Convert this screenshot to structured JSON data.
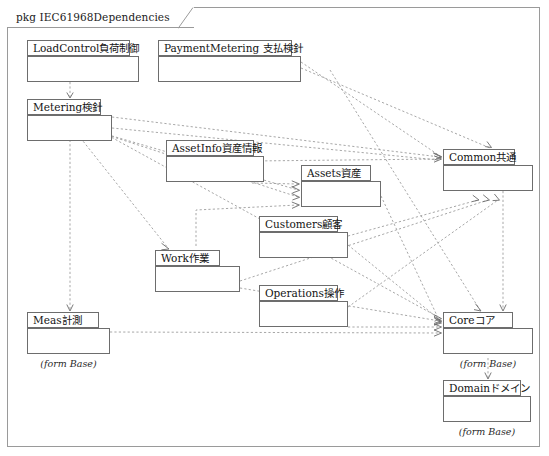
{
  "frame": {
    "keyword": "pkg",
    "name": "IEC61968Dependencies",
    "title": "pkg IEC61968Dependencies"
  },
  "packages": [
    {
      "id": "loadcontrol",
      "label": "LoadControl負荷制御",
      "name_en": "LoadControl",
      "name_ja": "負荷制御",
      "note": "",
      "x": 27,
      "y": 40,
      "tab_w": 103,
      "tab_h": 16,
      "body_w": 112,
      "body_h": 26
    },
    {
      "id": "paymentmetering",
      "label": "PaymentMetering 支払検針",
      "name_en": "PaymentMetering",
      "name_ja": "支払検針",
      "note": "",
      "x": 158,
      "y": 40,
      "tab_w": 134,
      "tab_h": 16,
      "body_w": 143,
      "body_h": 26
    },
    {
      "id": "metering",
      "label": "Metering検針",
      "name_en": "Metering",
      "name_ja": "検針",
      "note": "",
      "x": 27,
      "y": 99,
      "tab_w": 74,
      "tab_h": 16,
      "body_w": 85,
      "body_h": 26
    },
    {
      "id": "assetinfo",
      "label": "AssetInfo資産情報",
      "name_en": "AssetInfo",
      "name_ja": "資産情報",
      "note": "",
      "x": 166,
      "y": 140,
      "tab_w": 88,
      "tab_h": 16,
      "body_w": 98,
      "body_h": 26
    },
    {
      "id": "assets",
      "label": "Assets資産",
      "name_en": "Assets",
      "name_ja": "資産",
      "note": "",
      "x": 301,
      "y": 165,
      "tab_w": 70,
      "tab_h": 16,
      "body_w": 80,
      "body_h": 26
    },
    {
      "id": "customers",
      "label": "Customers顧客",
      "name_en": "Customers",
      "name_ja": "顧客",
      "note": "",
      "x": 259,
      "y": 216,
      "tab_w": 79,
      "tab_h": 16,
      "body_w": 89,
      "body_h": 26
    },
    {
      "id": "work",
      "label": "Work作業",
      "name_en": "Work",
      "name_ja": "作業",
      "note": "",
      "x": 155,
      "y": 250,
      "tab_w": 65,
      "tab_h": 16,
      "body_w": 85,
      "body_h": 26
    },
    {
      "id": "operations",
      "label": "Operations操作",
      "name_en": "Operations",
      "name_ja": "操作",
      "note": "",
      "x": 259,
      "y": 285,
      "tab_w": 79,
      "tab_h": 16,
      "body_w": 89,
      "body_h": 26
    },
    {
      "id": "meas",
      "label": "Meas計測",
      "name_en": "Meas",
      "name_ja": "計測",
      "note": "(form Base)",
      "x": 27,
      "y": 312,
      "tab_w": 72,
      "tab_h": 16,
      "body_w": 83,
      "body_h": 26
    },
    {
      "id": "common",
      "label": "Common共通",
      "name_en": "Common",
      "name_ja": "共通",
      "note": "",
      "x": 443,
      "y": 149,
      "tab_w": 72,
      "tab_h": 16,
      "body_w": 90,
      "body_h": 26
    },
    {
      "id": "core",
      "label": "Coreコア",
      "name_en": "Core",
      "name_ja": "コア",
      "note": "(form Base)",
      "x": 443,
      "y": 312,
      "tab_w": 70,
      "tab_h": 16,
      "body_w": 90,
      "body_h": 26
    },
    {
      "id": "domain",
      "label": "Domainドメイン",
      "name_en": "Domain",
      "name_ja": "ドメイン",
      "note": "(form Base)",
      "x": 443,
      "y": 380,
      "tab_w": 78,
      "tab_h": 16,
      "body_w": 88,
      "body_h": 26
    }
  ],
  "dependencies": [
    {
      "from": "loadcontrol",
      "to": "metering"
    },
    {
      "from": "paymentmetering",
      "to": "common"
    },
    {
      "from": "paymentmetering",
      "to": "core"
    },
    {
      "from": "metering",
      "to": "common"
    },
    {
      "from": "metering",
      "to": "assets"
    },
    {
      "from": "metering",
      "to": "work"
    },
    {
      "from": "metering",
      "to": "meas"
    },
    {
      "from": "metering",
      "to": "core"
    },
    {
      "from": "assetinfo",
      "to": "common"
    },
    {
      "from": "assetinfo",
      "to": "assets"
    },
    {
      "from": "assets",
      "to": "core"
    },
    {
      "from": "customers",
      "to": "common"
    },
    {
      "from": "customers",
      "to": "core"
    },
    {
      "from": "work",
      "to": "assets"
    },
    {
      "from": "work",
      "to": "common"
    },
    {
      "from": "work",
      "to": "core"
    },
    {
      "from": "operations",
      "to": "common"
    },
    {
      "from": "operations",
      "to": "core"
    },
    {
      "from": "meas",
      "to": "core"
    },
    {
      "from": "common",
      "to": "core"
    },
    {
      "from": "core",
      "to": "domain"
    }
  ],
  "colors": {
    "frame_border": "#9a9a9a",
    "package_border": "#6d6d6d",
    "dependency_line": "#9d9d9d",
    "text": "#131313",
    "background": "#ffffff"
  }
}
